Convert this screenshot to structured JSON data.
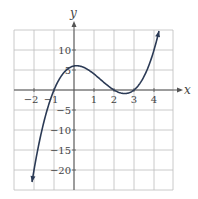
{
  "chart_data": {
    "type": "line",
    "title": "",
    "xlabel": "x",
    "ylabel": "y",
    "xlim": [
      -3,
      5
    ],
    "ylim": [
      -25,
      15
    ],
    "grid": true,
    "x_ticks": [
      -2,
      -1,
      1,
      2,
      3,
      4
    ],
    "y_ticks": [
      10,
      5,
      -5,
      -10,
      -15,
      -20
    ],
    "x_tick_labels": [
      "−2",
      "−1",
      "1",
      "2",
      "3",
      "4"
    ],
    "y_tick_labels": [
      "10",
      "5",
      "−5",
      "−10",
      "−15",
      "−20"
    ],
    "series": [
      {
        "name": "f(x) = (x+1)(x-2)(x-3)",
        "x": [
          -2.1,
          -2,
          -1.5,
          -1,
          -0.5,
          0,
          0.5,
          1,
          1.5,
          2,
          2.5,
          3,
          3.5,
          4,
          4.25
        ],
        "values": [
          -23.0,
          -20,
          -11.25,
          0,
          4.38,
          6,
          5.63,
          4,
          1.88,
          0,
          -0.88,
          0,
          1.88,
          10,
          14.8
        ],
        "color": "#2b3a55"
      }
    ]
  }
}
